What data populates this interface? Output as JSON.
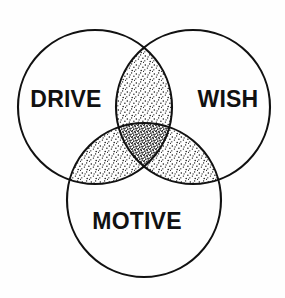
{
  "diagram": {
    "type": "venn-3-circle",
    "title": "",
    "background_color": "#fefefe",
    "stroke_color": "#111111",
    "label_color": "#111111",
    "stipple_color": "#111111",
    "canvas": {
      "width": 285,
      "height": 298
    },
    "sets": [
      {
        "id": "drive",
        "label": "DRIVE",
        "position": "left",
        "center_x": 95,
        "center_y": 107,
        "radius": 77,
        "label_x": 66,
        "label_y": 101
      },
      {
        "id": "wish",
        "label": "WISH",
        "position": "right",
        "center_x": 193,
        "center_y": 107,
        "radius": 77,
        "label_x": 228,
        "label_y": 101
      },
      {
        "id": "motive",
        "label": "MOTIVE",
        "position": "bottom",
        "center_x": 144,
        "center_y": 200,
        "radius": 77,
        "label_x": 137,
        "label_y": 223
      }
    ],
    "regions": [
      {
        "id": "drive-only",
        "sets": [
          "drive"
        ],
        "shaded": false,
        "stipple_density": 0
      },
      {
        "id": "wish-only",
        "sets": [
          "wish"
        ],
        "shaded": false,
        "stipple_density": 0
      },
      {
        "id": "motive-only",
        "sets": [
          "motive"
        ],
        "shaded": false,
        "stipple_density": 0
      },
      {
        "id": "drive-wish",
        "sets": [
          "drive",
          "wish"
        ],
        "shaded": true,
        "stipple_density": 1
      },
      {
        "id": "drive-motive",
        "sets": [
          "drive",
          "motive"
        ],
        "shaded": true,
        "stipple_density": 1
      },
      {
        "id": "wish-motive",
        "sets": [
          "wish",
          "motive"
        ],
        "shaded": true,
        "stipple_density": 1
      },
      {
        "id": "drive-wish-motive",
        "sets": [
          "drive",
          "wish",
          "motive"
        ],
        "shaded": true,
        "stipple_density": 3
      }
    ]
  }
}
